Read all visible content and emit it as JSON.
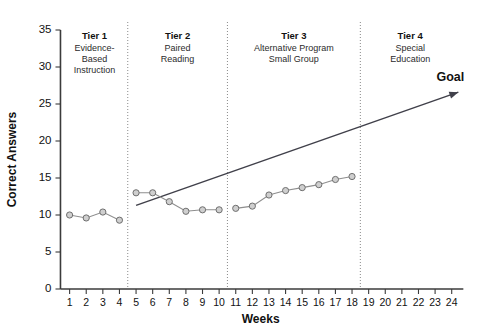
{
  "chart_data": {
    "type": "line",
    "title": "",
    "xlabel": "Weeks",
    "ylabel": "Correct Answers",
    "xlim": [
      0,
      24.8
    ],
    "ylim": [
      0,
      35
    ],
    "grid": false,
    "legend_position": "none",
    "x_ticks": [
      1,
      2,
      3,
      4,
      5,
      6,
      7,
      8,
      9,
      10,
      11,
      12,
      13,
      14,
      15,
      16,
      17,
      18,
      19,
      20,
      21,
      22,
      23,
      24
    ],
    "x_tick_labels": [
      "1",
      "2",
      "3",
      "4",
      "5",
      "6",
      "7",
      "8",
      "9",
      "10",
      "11",
      "12",
      "13",
      "14",
      "15",
      "16",
      "17",
      "18",
      "19",
      "20",
      "21",
      "22",
      "23",
      "24"
    ],
    "y_ticks": [
      0,
      5,
      10,
      15,
      20,
      25,
      30,
      35
    ],
    "y_tick_labels": [
      "0",
      "5",
      "10",
      "15",
      "20",
      "25",
      "30",
      "35"
    ],
    "series": [
      {
        "name": "Tier 1 phase",
        "x": [
          1,
          2,
          3,
          4
        ],
        "values": [
          10.0,
          9.6,
          10.4,
          9.3
        ]
      },
      {
        "name": "Tier 2 phase",
        "x": [
          5,
          6,
          7,
          8,
          9,
          10
        ],
        "values": [
          13.0,
          13.0,
          11.8,
          10.5,
          10.7,
          10.7
        ]
      },
      {
        "name": "Tier 3 phase",
        "x": [
          11,
          12,
          13,
          14,
          15,
          16,
          17,
          18
        ],
        "values": [
          10.9,
          11.2,
          12.7,
          13.3,
          13.7,
          14.1,
          14.8,
          15.2
        ]
      }
    ],
    "goal_line": {
      "label": "Goal",
      "x_start": 5.0,
      "y_start": 11.3,
      "x_end": 24.4,
      "y_end": 26.6,
      "arrow": true
    },
    "phase_dividers": [
      4.5,
      10.5,
      18.5
    ],
    "annotations": [
      {
        "id": "tier-1",
        "heading": "Tier 1",
        "lines": [
          "Evidence-",
          "Based",
          "Instruction"
        ],
        "x_center": 2.5
      },
      {
        "id": "tier-2",
        "heading": "Tier 2",
        "lines": [
          "Paired",
          "Reading"
        ],
        "x_center": 7.5
      },
      {
        "id": "tier-3",
        "heading": "Tier 3",
        "lines": [
          "Alternative Program",
          "Small Group"
        ],
        "x_center": 14.5
      },
      {
        "id": "tier-4",
        "heading": "Tier 4",
        "lines": [
          "Special",
          "Education"
        ],
        "x_center": 21.5
      }
    ]
  },
  "colors": {
    "axis": "#3b3b3b",
    "series_line": "#8e8e8e",
    "series_marker_fill": "#cfcfcf",
    "series_marker_stroke": "#6f6f6f",
    "goal": "#40404a",
    "divider": "#8a8a8a",
    "background": "#ffffff"
  }
}
